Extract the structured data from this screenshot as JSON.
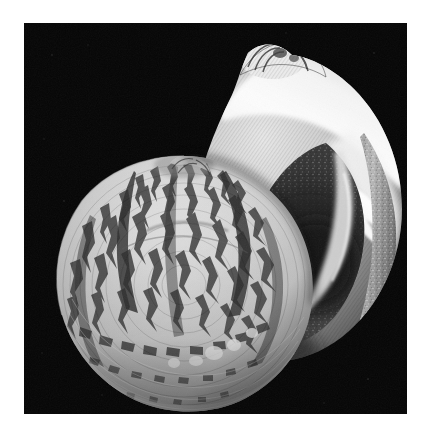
{
  "page": {
    "background_color": "#ffffff",
    "width": 433,
    "height": 435,
    "visible_text": ""
  },
  "photo": {
    "name": "shell-photograph",
    "background_color": "#050505",
    "frame": {
      "x": 24,
      "y": 23,
      "width": 383,
      "height": 391
    },
    "description": "Black and white photograph of two moon snail shells on a black background",
    "palette": {
      "black": "#050505",
      "deep_shadow": "#141414",
      "mid_shadow": "#3a3a3a",
      "dark_grey": "#5a5a5a",
      "mid_grey": "#8e8e8e",
      "light_grey": "#c6c6c6",
      "pale": "#e4e4e4",
      "highlight": "#f7f7f7",
      "pattern_dark": "#4a4a4a",
      "pattern_darkest": "#2b2b2b"
    },
    "subjects": [
      {
        "name": "rear-shell",
        "label": "rear shell",
        "surface": "smooth glossy white-to-grey body whorl",
        "center_x": 266,
        "center_y": 200,
        "radius_x": 118,
        "radius_y": 130,
        "features": [
          "bright white outer lip / callus arc across the top",
          "small ribbed spire apex at top center",
          "dark shadowed aperture and umbilicus on the lower right",
          "finely granular shell margin on the right rim"
        ]
      },
      {
        "name": "front-shell",
        "label": "front shell",
        "surface": "mottled zebra-striped radial flame pattern",
        "center_x": 160,
        "center_y": 262,
        "radius_x": 126,
        "radius_y": 130,
        "features": [
          "pointed apex at the upper area",
          "dark radial flame blotches arranged in concentric bands",
          "fine spiral growth lines near the lower margin",
          "light scalloped basal edge"
        ]
      }
    ]
  }
}
